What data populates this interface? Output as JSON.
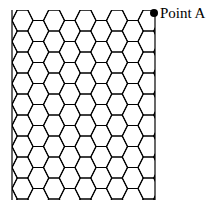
{
  "figure": {
    "type": "hexagonal-lattice-diagram",
    "background_color": "#ffffff",
    "line_color": "#000000",
    "top_artifact_text": "— —— —— — ——"
  },
  "grid": {
    "name": "honeycomb-grid",
    "shape": "flat-top-hexagon",
    "columns": 8,
    "rows": 10,
    "hex_width": 21,
    "hex_height": 21,
    "stroke_width": 1.1,
    "bounds": {
      "left": 12,
      "top": 10,
      "right": 155,
      "bottom": 200
    }
  },
  "marker": {
    "name": "point-a-marker",
    "label": "Point A",
    "dot_x": 154,
    "dot_y": 13,
    "dot_radius": 4,
    "dot_color": "#000000"
  }
}
